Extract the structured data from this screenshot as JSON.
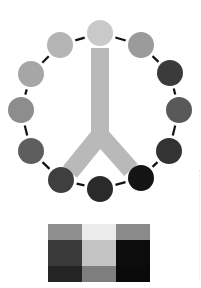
{
  "diagram": {
    "ring": {
      "center": [
        100,
        111
      ],
      "node_radius": 13,
      "connector_color": "#111111",
      "nodes": [
        {
          "id": "n0",
          "x": 100,
          "y": 33,
          "color": "#c9c9c9"
        },
        {
          "id": "n1",
          "x": 141,
          "y": 45,
          "color": "#9b9b9b"
        },
        {
          "id": "n2",
          "x": 170,
          "y": 73,
          "color": "#3b3b3b"
        },
        {
          "id": "n3",
          "x": 179,
          "y": 110,
          "color": "#595959"
        },
        {
          "id": "n4",
          "x": 169,
          "y": 151,
          "color": "#333333"
        },
        {
          "id": "n5",
          "x": 141,
          "y": 178,
          "color": "#141414"
        },
        {
          "id": "n6",
          "x": 100,
          "y": 189,
          "color": "#2a2a2a"
        },
        {
          "id": "n7",
          "x": 61,
          "y": 180,
          "color": "#3f3f3f"
        },
        {
          "id": "n8",
          "x": 31,
          "y": 151,
          "color": "#5e5e5e"
        },
        {
          "id": "n9",
          "x": 21,
          "y": 110,
          "color": "#8d8d8d"
        },
        {
          "id": "n10",
          "x": 31,
          "y": 74,
          "color": "#a6a6a6"
        },
        {
          "id": "n11",
          "x": 60,
          "y": 45,
          "color": "#b4b4b4"
        }
      ]
    },
    "stem": {
      "color": "#b9b9b9",
      "width": 18,
      "top": [
        100,
        48
      ],
      "fork": [
        100,
        135
      ],
      "left_end": [
        70,
        172
      ],
      "right_end": [
        131,
        170
      ]
    }
  },
  "swatch_grid": {
    "rows": [
      [
        "#8f8f8f",
        "#ececec",
        "#8a8a8a"
      ],
      [
        "#3a3a3a",
        "#c4c4c4",
        "#0c0c0c"
      ],
      [
        "#242424",
        "#7e7e7e",
        "#0a0a0a"
      ]
    ]
  }
}
